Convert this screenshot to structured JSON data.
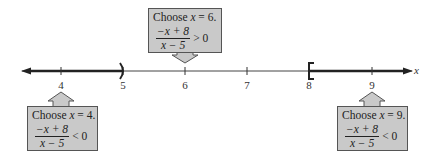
{
  "diagram": {
    "type": "number-line-sign-analysis",
    "axis": {
      "variable": "x",
      "ticks": [
        {
          "value": "4",
          "x": 61
        },
        {
          "value": "5",
          "x": 123
        },
        {
          "value": "6",
          "x": 185
        },
        {
          "value": "7",
          "x": 247
        },
        {
          "value": "8",
          "x": 309
        },
        {
          "value": "9",
          "x": 372
        }
      ],
      "endpoints": [
        {
          "at": "5",
          "symbol": ")",
          "type": "open"
        },
        {
          "at": "8",
          "symbol": "[",
          "type": "closed"
        }
      ],
      "shaded_intervals": [
        {
          "from": "-infinity",
          "to": "5",
          "closed_right": false
        },
        {
          "from": "8",
          "to": "infinity",
          "closed_left": true
        }
      ],
      "line_color": "#333333",
      "shade_color": "#222222"
    },
    "test_boxes": [
      {
        "id": "test-6",
        "title_prefix": "Choose ",
        "title_var": "x",
        "title_suffix": " = 6.",
        "numerator": "−x + 8",
        "denominator": "x − 5",
        "relation": "> 0",
        "position": "above"
      },
      {
        "id": "test-4",
        "title_prefix": "Choose ",
        "title_var": "x",
        "title_suffix": " = 4.",
        "numerator": "−x + 8",
        "denominator": "x − 5",
        "relation": "< 0",
        "position": "below"
      },
      {
        "id": "test-9",
        "title_prefix": "Choose ",
        "title_var": "x",
        "title_suffix": " = 9.",
        "numerator": "−x + 8",
        "denominator": "x − 5",
        "relation": "< 0",
        "position": "below"
      }
    ],
    "box_fill": "#c9c9c9",
    "box_border": "#555555"
  }
}
